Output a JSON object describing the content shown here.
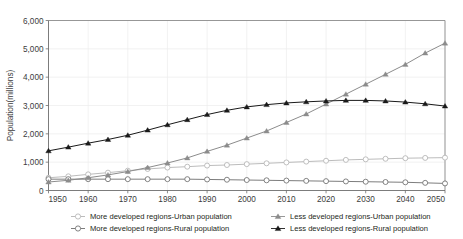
{
  "chart_data": {
    "type": "line",
    "title": "",
    "xlabel": "",
    "ylabel": "Population(millions)",
    "xlim": [
      1950,
      2050
    ],
    "ylim": [
      0,
      6000
    ],
    "grid": true,
    "legend_position": "bottom",
    "x_ticks": [
      "1950",
      "1960",
      "1970",
      "1980",
      "1990",
      "2000",
      "2010",
      "2020",
      "2030",
      "2040",
      "2050"
    ],
    "y_ticks": [
      "0",
      "1,000",
      "2,000",
      "3,000",
      "4,000",
      "5,000",
      "6,000"
    ],
    "x": [
      1950,
      1955,
      1960,
      1965,
      1970,
      1975,
      1980,
      1985,
      1990,
      1995,
      2000,
      2005,
      2010,
      2015,
      2020,
      2025,
      2030,
      2035,
      2040,
      2045,
      2050
    ],
    "series": [
      {
        "name": "More developed regions-Urban population",
        "marker": "open-circle",
        "color": "#b4b4b4",
        "values": [
          450,
          500,
          570,
          630,
          700,
          760,
          810,
          840,
          880,
          900,
          930,
          960,
          990,
          1020,
          1050,
          1080,
          1100,
          1120,
          1140,
          1150,
          1160
        ]
      },
      {
        "name": "More developed regions-Rural population",
        "marker": "open-circle",
        "color": "#6e6e6e",
        "values": [
          400,
          400,
          400,
          400,
          400,
          400,
          400,
          400,
          390,
          380,
          370,
          360,
          350,
          340,
          330,
          320,
          310,
          300,
          290,
          270,
          250
        ]
      },
      {
        "name": "Less developed regions-Urban population",
        "marker": "filled-triangle",
        "color": "#8c8c8c",
        "values": [
          300,
          360,
          450,
          550,
          670,
          810,
          970,
          1150,
          1380,
          1600,
          1850,
          2100,
          2400,
          2700,
          3050,
          3400,
          3750,
          4100,
          4450,
          4850,
          5200
        ]
      },
      {
        "name": "Less developed regions-Rural population",
        "marker": "filled-triangle",
        "color": "#1a1a1a",
        "values": [
          1400,
          1530,
          1670,
          1800,
          1950,
          2130,
          2320,
          2500,
          2680,
          2830,
          2950,
          3030,
          3090,
          3130,
          3160,
          3180,
          3180,
          3160,
          3120,
          3060,
          2980
        ]
      }
    ]
  },
  "legend": {
    "items": [
      {
        "label": "More developed regions-Urban population",
        "marker": "open-circle",
        "color": "#b4b4b4"
      },
      {
        "label": "Less developed regions-Urban population",
        "marker": "filled-triangle",
        "color": "#8c8c8c"
      },
      {
        "label": "More developed regions-Rural population",
        "marker": "open-circle",
        "color": "#6e6e6e"
      },
      {
        "label": "Less developed regions-Rural population",
        "marker": "filled-triangle",
        "color": "#1a1a1a"
      }
    ]
  }
}
